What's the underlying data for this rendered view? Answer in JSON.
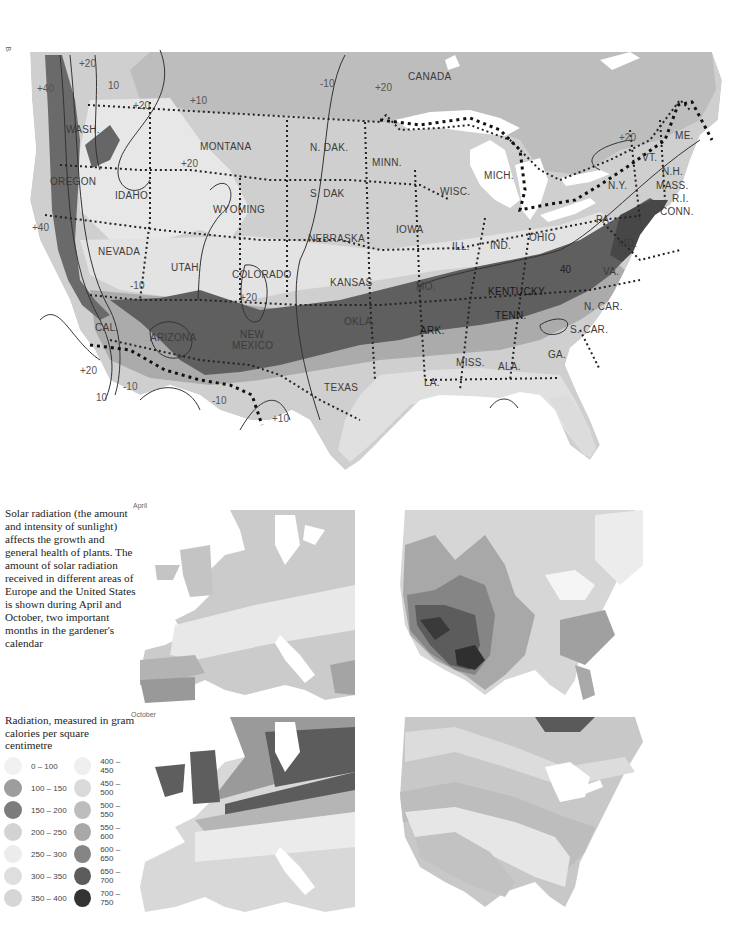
{
  "credit": "Based on Arnold Arboretum hardiness zones",
  "main_map": {
    "country_labels": [
      "CANADA"
    ],
    "state_labels": [
      {
        "name": "WASH.",
        "x": 66,
        "y": 124
      },
      {
        "name": "OREGON",
        "x": 50,
        "y": 176
      },
      {
        "name": "IDAHO",
        "x": 115,
        "y": 190
      },
      {
        "name": "MONTANA",
        "x": 200,
        "y": 141
      },
      {
        "name": "N. DAK.",
        "x": 310,
        "y": 142
      },
      {
        "name": "MINN.",
        "x": 372,
        "y": 157
      },
      {
        "name": "S. DAK",
        "x": 310,
        "y": 188
      },
      {
        "name": "WISC.",
        "x": 440,
        "y": 186
      },
      {
        "name": "MICH.",
        "x": 484,
        "y": 170
      },
      {
        "name": "N.Y.",
        "x": 608,
        "y": 180
      },
      {
        "name": "VT.",
        "x": 642,
        "y": 152
      },
      {
        "name": "N.H.",
        "x": 662,
        "y": 168
      },
      {
        "name": "MASS.",
        "x": 656,
        "y": 182
      },
      {
        "name": "R.I.",
        "x": 672,
        "y": 195
      },
      {
        "name": "CONN.",
        "x": 660,
        "y": 207
      },
      {
        "name": "ME.",
        "x": 675,
        "y": 133
      },
      {
        "name": "PA.",
        "x": 596,
        "y": 214
      },
      {
        "name": "OHIO",
        "x": 529,
        "y": 232
      },
      {
        "name": "IND.",
        "x": 490,
        "y": 240
      },
      {
        "name": "ILL.",
        "x": 452,
        "y": 241
      },
      {
        "name": "IOWA",
        "x": 396,
        "y": 226
      },
      {
        "name": "NEBRASKA",
        "x": 308,
        "y": 234
      },
      {
        "name": "WYOMING",
        "x": 213,
        "y": 205
      },
      {
        "name": "NEVADA",
        "x": 98,
        "y": 247
      },
      {
        "name": "UTAH",
        "x": 171,
        "y": 263
      },
      {
        "name": "COLORADO",
        "x": 232,
        "y": 270
      },
      {
        "name": "KANSAS",
        "x": 330,
        "y": 278
      },
      {
        "name": "MO.",
        "x": 416,
        "y": 283
      },
      {
        "name": "KENTUCKY",
        "x": 488,
        "y": 288
      },
      {
        "name": "VA.",
        "x": 603,
        "y": 268
      },
      {
        "name": "MD.",
        "x": 618,
        "y": 240
      },
      {
        "name": "N. CAR.",
        "x": 584,
        "y": 302
      },
      {
        "name": "TENN.",
        "x": 495,
        "y": 312
      },
      {
        "name": "S. CAR.",
        "x": 570,
        "y": 326
      },
      {
        "name": "OKLA.",
        "x": 344,
        "y": 318
      },
      {
        "name": "ARK.",
        "x": 420,
        "y": 327
      },
      {
        "name": "CAL.",
        "x": 95,
        "y": 323
      },
      {
        "name": "ARIZONA",
        "x": 150,
        "y": 333
      },
      {
        "name": "NEW",
        "x": 240,
        "y": 330
      },
      {
        "name": "MEXICO",
        "x": 232,
        "y": 342
      },
      {
        "name": "MISS.",
        "x": 456,
        "y": 358
      },
      {
        "name": "ALA.",
        "x": 498,
        "y": 362
      },
      {
        "name": "GA.",
        "x": 548,
        "y": 350
      },
      {
        "name": "LA.",
        "x": 424,
        "y": 378
      },
      {
        "name": "TEXAS",
        "x": 324,
        "y": 383
      }
    ],
    "isotherm_labels": [
      {
        "t": "+20",
        "x": 79,
        "y": 60
      },
      {
        "t": "+40",
        "x": 37,
        "y": 85
      },
      {
        "t": "10",
        "x": 108,
        "y": 81
      },
      {
        "t": "+20",
        "x": 133,
        "y": 101
      },
      {
        "t": "+10",
        "x": 190,
        "y": 96
      },
      {
        "t": "-10",
        "x": 320,
        "y": 79
      },
      {
        "t": "+20",
        "x": 375,
        "y": 83
      },
      {
        "t": "+20",
        "x": 181,
        "y": 160
      },
      {
        "t": "+20",
        "x": 619,
        "y": 133
      },
      {
        "t": "+40",
        "x": 32,
        "y": 223
      },
      {
        "t": "-10",
        "x": 130,
        "y": 281
      },
      {
        "t": "+20",
        "x": 240,
        "y": 293
      },
      {
        "t": "40",
        "x": 560,
        "y": 265
      },
      {
        "t": "+20",
        "x": 80,
        "y": 366
      },
      {
        "t": "-10",
        "x": 123,
        "y": 382
      },
      {
        "t": "10",
        "x": 96,
        "y": 393
      },
      {
        "t": "-10",
        "x": 212,
        "y": 396
      },
      {
        "t": "+10",
        "x": 272,
        "y": 414
      }
    ]
  },
  "description": "Solar radiation (the amount and intensity of sunlight) affects the growth and general health of plants. The amount of solar radiation received in different areas of Europe and the United States is shown during April and October, two important months in the gardener's calendar",
  "legend": {
    "title": "Radiation, measured in gram calories per square centimetre",
    "items": [
      {
        "range": "0 – 100",
        "color": "#f1f1f1"
      },
      {
        "range": "100 – 150",
        "color": "#9d9d9d"
      },
      {
        "range": "150 – 200",
        "color": "#7c7c7c"
      },
      {
        "range": "200 – 250",
        "color": "#d3d3d3"
      },
      {
        "range": "250 – 300",
        "color": "#ececec"
      },
      {
        "range": "300 – 350",
        "color": "#dedede"
      },
      {
        "range": "350 – 400",
        "color": "#d6d6d6"
      },
      {
        "range": "400 – 450",
        "color": "#efefef"
      },
      {
        "range": "450 – 500",
        "color": "#dadada"
      },
      {
        "range": "500 – 550",
        "color": "#bdbdbd"
      },
      {
        "range": "550 – 600",
        "color": "#a8a8a8"
      },
      {
        "range": "600 – 650",
        "color": "#858585"
      },
      {
        "range": "650 – 700",
        "color": "#5c5c5c"
      },
      {
        "range": "700 – 750",
        "color": "#333333"
      }
    ]
  },
  "mini_maps": {
    "april_label": "April",
    "october_label": "October"
  },
  "colors": {
    "land_light": "#e6e6e6",
    "land_mid": "#c8c8c8",
    "land_dark": "#8a8a8a",
    "band_darkest": "#5d5d5d",
    "water": "#ffffff",
    "contour": "#333333"
  }
}
